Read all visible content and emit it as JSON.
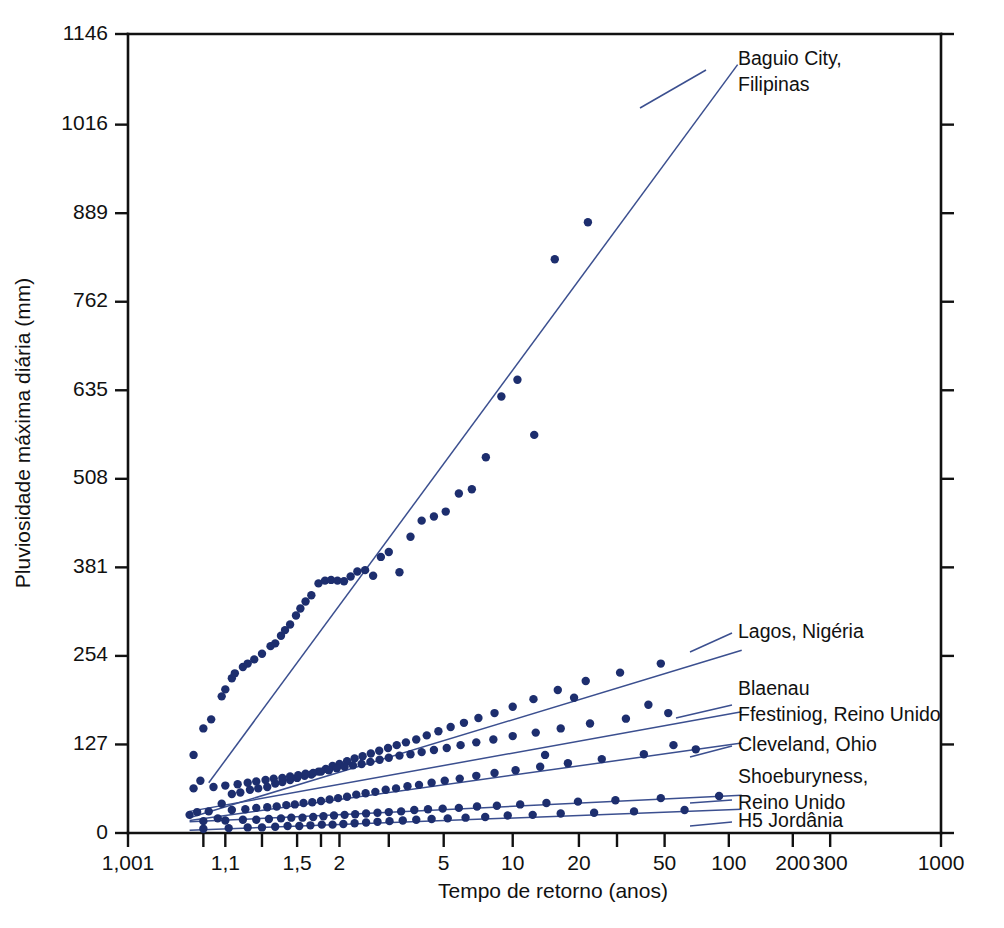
{
  "chart_data": {
    "type": "scatter",
    "title": "",
    "xlabel": "Tempo de retorno (anos)",
    "ylabel": "Pluviosidade máxima diária (mm)",
    "x_scale": "gumbel-return-period",
    "grid": false,
    "legend_position": "right-inline-labels",
    "xlim": [
      1.001,
      1000
    ],
    "ylim": [
      0,
      1146
    ],
    "xticks": [
      {
        "value": 1.001,
        "label": "1,001"
      },
      {
        "value": 1.05,
        "label": ""
      },
      {
        "value": 1.1,
        "label": "1,1"
      },
      {
        "value": 1.25,
        "label": ""
      },
      {
        "value": 1.5,
        "label": "1,5"
      },
      {
        "value": 1.75,
        "label": ""
      },
      {
        "value": 2,
        "label": "2"
      },
      {
        "value": 3,
        "label": ""
      },
      {
        "value": 5,
        "label": "5"
      },
      {
        "value": 10,
        "label": "10"
      },
      {
        "value": 20,
        "label": "20"
      },
      {
        "value": 30,
        "label": ""
      },
      {
        "value": 50,
        "label": "50"
      },
      {
        "value": 100,
        "label": "100"
      },
      {
        "value": 200,
        "label": "200"
      },
      {
        "value": 300,
        "label": "300"
      },
      {
        "value": 1000,
        "label": "1000"
      }
    ],
    "yticks": [
      {
        "value": 0,
        "label": "0"
      },
      {
        "value": 127,
        "label": "127"
      },
      {
        "value": 254,
        "label": "254"
      },
      {
        "value": 381,
        "label": "381"
      },
      {
        "value": 508,
        "label": "508"
      },
      {
        "value": 635,
        "label": "635"
      },
      {
        "value": 762,
        "label": "762"
      },
      {
        "value": 889,
        "label": "889"
      },
      {
        "value": 1016,
        "label": "1016"
      },
      {
        "value": 1146,
        "label": "1146"
      }
    ],
    "colors": {
      "point": "#1d2e6e",
      "line": "#3b4f8f",
      "axis": "#111111"
    },
    "series": [
      {
        "name": "Baguio City, Filipinas",
        "label": "Baguio City,\nFilipinas",
        "label_lines": [
          "Baguio City,",
          "Filipinas"
        ],
        "trend": {
          "x1": 1.06,
          "y1": 72,
          "x2": 110,
          "y2": 1102
        },
        "points": [
          [
            1.035,
            112
          ],
          [
            1.05,
            150
          ],
          [
            1.065,
            163
          ],
          [
            1.045,
            75
          ],
          [
            1.09,
            196
          ],
          [
            1.1,
            206
          ],
          [
            1.12,
            222
          ],
          [
            1.13,
            229
          ],
          [
            1.16,
            238
          ],
          [
            1.18,
            243
          ],
          [
            1.21,
            249
          ],
          [
            1.25,
            257
          ],
          [
            1.3,
            268
          ],
          [
            1.33,
            272
          ],
          [
            1.37,
            283
          ],
          [
            1.4,
            291
          ],
          [
            1.44,
            299
          ],
          [
            1.49,
            312
          ],
          [
            1.53,
            322
          ],
          [
            1.58,
            332
          ],
          [
            1.64,
            341
          ],
          [
            1.72,
            358
          ],
          [
            1.8,
            362
          ],
          [
            1.88,
            363
          ],
          [
            1.97,
            362
          ],
          [
            2.07,
            361
          ],
          [
            2.18,
            368
          ],
          [
            2.3,
            375
          ],
          [
            2.45,
            377
          ],
          [
            2.62,
            369
          ],
          [
            2.8,
            396
          ],
          [
            3.0,
            403
          ],
          [
            3.3,
            374
          ],
          [
            3.65,
            425
          ],
          [
            4.05,
            448
          ],
          [
            4.55,
            454
          ],
          [
            5.1,
            461
          ],
          [
            5.8,
            487
          ],
          [
            6.6,
            493
          ],
          [
            7.6,
            539
          ],
          [
            8.9,
            626
          ],
          [
            10.5,
            650
          ],
          [
            12.5,
            571
          ],
          [
            15.5,
            823
          ],
          [
            22.0,
            876
          ]
        ]
      },
      {
        "name": "Lagos, Nigéria",
        "label": "Lagos, Nigéria",
        "label_lines": [
          "Lagos, Nigéria"
        ],
        "trend": {
          "x1": 1.03,
          "y1": 22,
          "x2": 115,
          "y2": 262
        },
        "points": [
          [
            1.03,
            26
          ],
          [
            1.06,
            31
          ],
          [
            1.09,
            42
          ],
          [
            1.12,
            56
          ],
          [
            1.15,
            58
          ],
          [
            1.19,
            62
          ],
          [
            1.23,
            64
          ],
          [
            1.28,
            66
          ],
          [
            1.33,
            71
          ],
          [
            1.38,
            73
          ],
          [
            1.44,
            76
          ],
          [
            1.5,
            79
          ],
          [
            1.57,
            82
          ],
          [
            1.64,
            84
          ],
          [
            1.72,
            88
          ],
          [
            1.81,
            92
          ],
          [
            1.9,
            96
          ],
          [
            2.0,
            99
          ],
          [
            2.12,
            103
          ],
          [
            2.25,
            107
          ],
          [
            2.4,
            110
          ],
          [
            2.57,
            114
          ],
          [
            2.76,
            118
          ],
          [
            2.98,
            122
          ],
          [
            3.22,
            126
          ],
          [
            3.5,
            130
          ],
          [
            3.85,
            134
          ],
          [
            4.25,
            140
          ],
          [
            4.75,
            146
          ],
          [
            5.35,
            152
          ],
          [
            6.1,
            158
          ],
          [
            7.05,
            165
          ],
          [
            8.3,
            172
          ],
          [
            10.0,
            181
          ],
          [
            12.4,
            192
          ],
          [
            16.0,
            205
          ],
          [
            21.5,
            218
          ],
          [
            31.0,
            230
          ],
          [
            48.0,
            243
          ]
        ]
      },
      {
        "name": "Blaenau Ffestiniog, Reino Unido",
        "label": "Blaenau\nFfestiniog, Reino Unido",
        "label_lines": [
          "Blaenau",
          "Ffestiniog, Reino Unido"
        ],
        "trend": {
          "x1": 1.03,
          "y1": 31,
          "x2": 115,
          "y2": 174
        },
        "points": [
          [
            1.035,
            64
          ],
          [
            1.07,
            66
          ],
          [
            1.1,
            68
          ],
          [
            1.14,
            70
          ],
          [
            1.18,
            72
          ],
          [
            1.22,
            74
          ],
          [
            1.27,
            76
          ],
          [
            1.32,
            78
          ],
          [
            1.38,
            79
          ],
          [
            1.44,
            81
          ],
          [
            1.51,
            83
          ],
          [
            1.58,
            85
          ],
          [
            1.66,
            86
          ],
          [
            1.75,
            88
          ],
          [
            1.85,
            90
          ],
          [
            1.96,
            93
          ],
          [
            2.08,
            95
          ],
          [
            2.22,
            97
          ],
          [
            2.38,
            99
          ],
          [
            2.56,
            102
          ],
          [
            2.77,
            105
          ],
          [
            3.0,
            108
          ],
          [
            3.3,
            111
          ],
          [
            3.65,
            113
          ],
          [
            4.05,
            116
          ],
          [
            4.55,
            119
          ],
          [
            5.15,
            122
          ],
          [
            5.9,
            126
          ],
          [
            6.9,
            130
          ],
          [
            8.2,
            134
          ],
          [
            10.0,
            139
          ],
          [
            12.7,
            144
          ],
          [
            16.5,
            150
          ],
          [
            22.5,
            157
          ],
          [
            33.0,
            164
          ],
          [
            52.0,
            172
          ],
          [
            19.0,
            194
          ],
          [
            42.0,
            184
          ]
        ]
      },
      {
        "name": "Cleveland, Ohio",
        "label": "Cleveland, Ohio",
        "label_lines": [
          "Cleveland, Ohio"
        ],
        "trend": {
          "x1": 1.03,
          "y1": 18,
          "x2": 115,
          "y2": 129
        },
        "points": [
          [
            1.04,
            30
          ],
          [
            1.08,
            21
          ],
          [
            1.12,
            33
          ],
          [
            1.17,
            34
          ],
          [
            1.22,
            36
          ],
          [
            1.28,
            37
          ],
          [
            1.34,
            38
          ],
          [
            1.41,
            40
          ],
          [
            1.48,
            41
          ],
          [
            1.56,
            43
          ],
          [
            1.65,
            44
          ],
          [
            1.75,
            46
          ],
          [
            1.86,
            48
          ],
          [
            1.98,
            50
          ],
          [
            2.12,
            52
          ],
          [
            2.28,
            55
          ],
          [
            2.46,
            57
          ],
          [
            2.67,
            59
          ],
          [
            2.92,
            62
          ],
          [
            3.2,
            64
          ],
          [
            3.55,
            67
          ],
          [
            3.95,
            69
          ],
          [
            4.45,
            72
          ],
          [
            5.05,
            75
          ],
          [
            5.85,
            78
          ],
          [
            6.9,
            82
          ],
          [
            8.3,
            86
          ],
          [
            10.3,
            90
          ],
          [
            13.3,
            95
          ],
          [
            17.8,
            100
          ],
          [
            25.5,
            106
          ],
          [
            40.0,
            113
          ],
          [
            70.0,
            120
          ],
          [
            14.0,
            112
          ],
          [
            55.0,
            126
          ]
        ]
      },
      {
        "name": "Shoeburyness, Reino Unido",
        "label": "Shoeburyness,\nReino Unido",
        "label_lines": [
          "Shoeburyness,",
          "Reino Unido"
        ],
        "trend": {
          "x1": 1.03,
          "y1": 16,
          "x2": 115,
          "y2": 54
        },
        "points": [
          [
            1.05,
            17
          ],
          [
            1.1,
            18
          ],
          [
            1.16,
            19
          ],
          [
            1.22,
            19
          ],
          [
            1.29,
            20
          ],
          [
            1.37,
            21
          ],
          [
            1.45,
            22
          ],
          [
            1.55,
            22
          ],
          [
            1.66,
            23
          ],
          [
            1.78,
            24
          ],
          [
            1.92,
            25
          ],
          [
            2.08,
            26
          ],
          [
            2.26,
            27
          ],
          [
            2.47,
            28
          ],
          [
            2.72,
            29
          ],
          [
            3.0,
            30
          ],
          [
            3.35,
            31
          ],
          [
            3.78,
            33
          ],
          [
            4.3,
            34
          ],
          [
            4.95,
            35
          ],
          [
            5.8,
            36
          ],
          [
            6.95,
            38
          ],
          [
            8.5,
            39
          ],
          [
            10.8,
            41
          ],
          [
            14.2,
            43
          ],
          [
            19.8,
            45
          ],
          [
            29.5,
            47
          ],
          [
            48.0,
            50
          ],
          [
            90.0,
            53
          ]
        ]
      },
      {
        "name": "H5 Jordânia",
        "label": "H5 Jordânia",
        "label_lines": [
          "H5 Jordânia"
        ],
        "trend": {
          "x1": 1.03,
          "y1": 4,
          "x2": 115,
          "y2": 34
        },
        "points": [
          [
            1.05,
            6
          ],
          [
            1.11,
            7
          ],
          [
            1.18,
            8
          ],
          [
            1.25,
            8
          ],
          [
            1.33,
            9
          ],
          [
            1.42,
            10
          ],
          [
            1.52,
            10
          ],
          [
            1.63,
            11
          ],
          [
            1.76,
            12
          ],
          [
            1.9,
            12
          ],
          [
            2.06,
            13
          ],
          [
            2.25,
            14
          ],
          [
            2.47,
            15
          ],
          [
            2.72,
            16
          ],
          [
            3.02,
            17
          ],
          [
            3.4,
            18
          ],
          [
            3.85,
            19
          ],
          [
            4.45,
            20
          ],
          [
            5.2,
            21
          ],
          [
            6.2,
            22
          ],
          [
            7.55,
            23
          ],
          [
            9.5,
            25
          ],
          [
            12.3,
            26
          ],
          [
            16.5,
            28
          ],
          [
            23.5,
            29
          ],
          [
            36.0,
            31
          ],
          [
            62.0,
            33
          ]
        ]
      }
    ]
  },
  "labels": {
    "baguio": [
      "Baguio City,",
      "Filipinas"
    ],
    "lagos": [
      "Lagos, Nigéria"
    ],
    "blaenau": [
      "Blaenau",
      "Ffestiniog, Reino Unido"
    ],
    "cleveland": [
      "Cleveland, Ohio"
    ],
    "shoeburyness": [
      "Shoeburyness,",
      "Reino Unido"
    ],
    "h5": [
      "H5 Jordânia"
    ]
  }
}
